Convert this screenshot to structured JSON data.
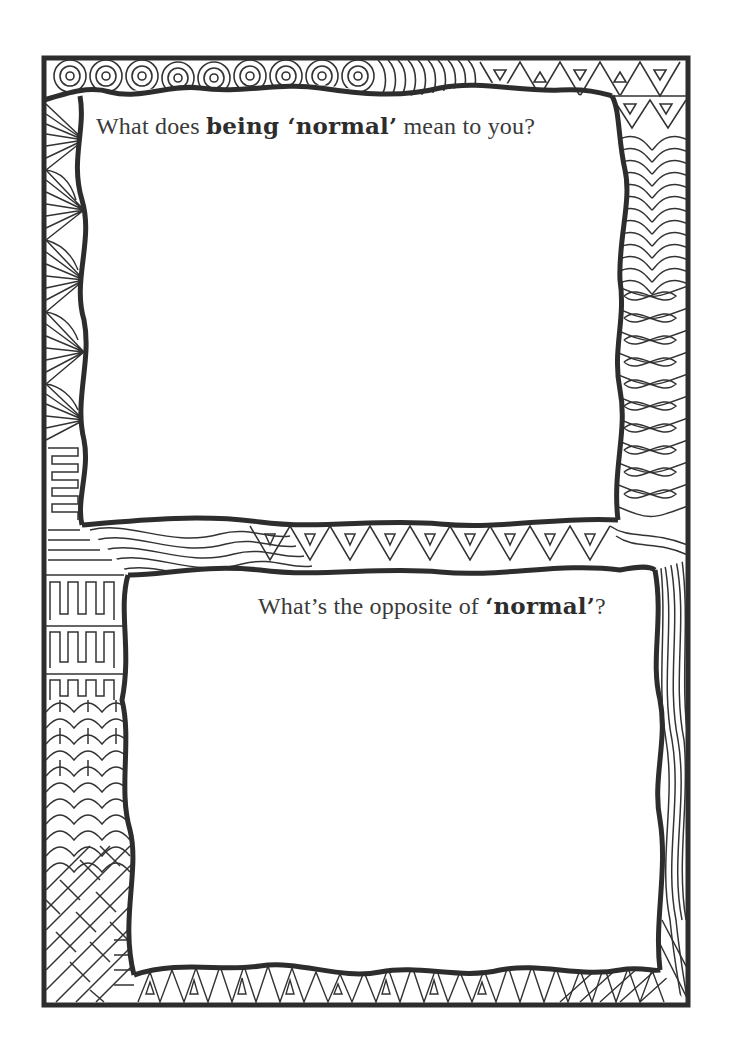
{
  "page": {
    "background": "#ffffff",
    "ink_color": "#2d2d2d"
  },
  "prompts": [
    {
      "before": "What does ",
      "emphasis": "being ‘normal’",
      "after": " mean to you?"
    },
    {
      "before": "What’s the opposite of ",
      "emphasis": "‘normal’",
      "after": "?"
    }
  ],
  "decorations": {
    "top_border": "spiral-and-triangle-pattern",
    "right_border_upper": "heart-and-infinity-loop-pattern",
    "right_border_lower": "wavy-line-pattern",
    "left_border_upper": "fan-pattern",
    "left_border_middle": "greek-key-pattern",
    "left_border_lower": "scale-and-brick-pattern",
    "middle_band": "wave-and-triangle-pattern",
    "bottom_border": "triangle-pattern"
  }
}
